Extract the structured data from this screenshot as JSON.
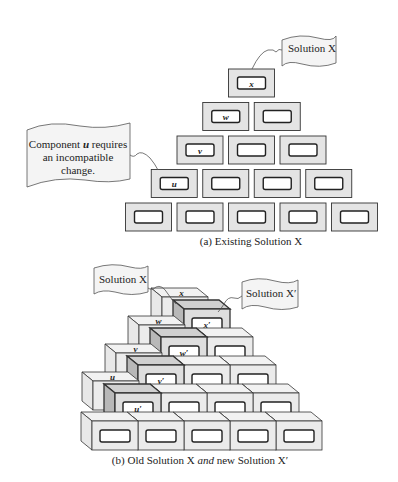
{
  "figure_a": {
    "caption": "(a) Existing Solution X",
    "callout_solution": "Solution X",
    "callout_component": [
      "Component u requires",
      "an incompatible",
      "change."
    ],
    "callout_component_emph": "u",
    "rows": [
      [
        "x"
      ],
      [
        "w",
        ""
      ],
      [
        "v",
        "",
        ""
      ],
      [
        "u",
        "",
        "",
        ""
      ],
      [
        "",
        "",
        "",
        "",
        ""
      ]
    ]
  },
  "figure_b": {
    "caption_parts": [
      "(b) Old Solution X ",
      "and",
      " new Solution X′"
    ],
    "callout_old": "Solution X",
    "callout_new": "Solution X′",
    "old_labels": [
      "x",
      "w",
      "v",
      "u"
    ],
    "new_labels": [
      "x′",
      "w′",
      "v′",
      "u′"
    ]
  },
  "colors": {
    "block_fill": "#e4e4e4",
    "block_stroke": "#333333",
    "inner_fill": "#ffffff",
    "side_fill": "#efefef",
    "dark_side": "#b8b8b8",
    "flag_fill": "#f4f4f4"
  }
}
